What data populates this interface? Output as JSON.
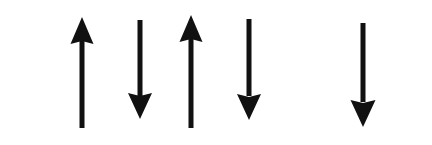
{
  "figure": {
    "name": "spin-configuration-diagram",
    "width": 432,
    "height": 145,
    "background_color": "#ffffff",
    "ink_color": "#111111"
  },
  "chart_data": {
    "type": "diagram",
    "title": "",
    "xlabel": "",
    "ylabel": "",
    "sites": [
      {
        "index": 1,
        "label": "site-1",
        "direction": "up",
        "value": 1,
        "center_x": 82,
        "occupied": true
      },
      {
        "index": 2,
        "label": "site-2",
        "direction": "down",
        "value": -1,
        "center_x": 140,
        "occupied": true
      },
      {
        "index": 3,
        "label": "site-3",
        "direction": "up",
        "value": 1,
        "center_x": 191,
        "occupied": true
      },
      {
        "index": 4,
        "label": "site-4",
        "direction": "down",
        "value": -1,
        "center_x": 249,
        "occupied": true
      },
      {
        "index": 5,
        "label": "site-5",
        "direction": "none",
        "value": 0,
        "center_x": 305,
        "occupied": false
      },
      {
        "index": 6,
        "label": "site-6",
        "direction": "down",
        "value": -1,
        "center_x": 363,
        "occupied": true
      }
    ],
    "sequence": [
      "up",
      "down",
      "up",
      "down",
      "vacancy",
      "down"
    ],
    "legend": [],
    "annotations": []
  },
  "arrows": [
    {
      "id": "arrow-1",
      "direction": "up",
      "shaft_x": 79.5,
      "shaft_width": 5.0,
      "shaft_top": 36,
      "shaft_bottom": 128,
      "head_left": 70.5,
      "head_right": 93.5,
      "head_tip_y": 17,
      "head_base_y": 44
    },
    {
      "id": "arrow-2",
      "direction": "down",
      "shaft_x": 137.5,
      "shaft_width": 5.0,
      "shaft_top": 20,
      "shaft_bottom": 96,
      "head_left": 128.0,
      "head_right": 152.0,
      "head_tip_y": 119,
      "head_base_y": 93
    },
    {
      "id": "arrow-3",
      "direction": "up",
      "shaft_x": 188.5,
      "shaft_width": 5.0,
      "shaft_top": 34,
      "shaft_bottom": 128,
      "head_left": 179.5,
      "head_right": 202.5,
      "head_tip_y": 15,
      "head_base_y": 42
    },
    {
      "id": "arrow-4",
      "direction": "down",
      "shaft_x": 246.5,
      "shaft_width": 5.0,
      "shaft_top": 19,
      "shaft_bottom": 96,
      "head_left": 237.0,
      "head_right": 261.0,
      "head_tip_y": 120,
      "head_base_y": 94
    },
    {
      "id": "arrow-6",
      "direction": "down",
      "shaft_x": 360.5,
      "shaft_width": 5.0,
      "shaft_top": 23,
      "shaft_bottom": 102,
      "head_left": 350.5,
      "head_right": 375.5,
      "head_tip_y": 127,
      "head_base_y": 100
    }
  ]
}
